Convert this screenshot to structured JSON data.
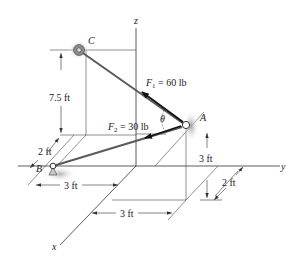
{
  "diagram": {
    "axes": {
      "x_label": "x",
      "y_label": "y",
      "z_label": "z"
    },
    "points": {
      "A": "A",
      "B": "B",
      "C": "C"
    },
    "forces": {
      "F1": {
        "symbol": "F",
        "subscript": "1",
        "value_text": " = 60 lb"
      },
      "F2": {
        "symbol": "F",
        "subscript": "2",
        "value_text": " = 30 lb"
      }
    },
    "angle_label": "θ",
    "dimensions": {
      "c_height": "7.5 ft",
      "b_offset_x": "2 ft",
      "b_offset_y": "3 ft",
      "a_offset_y": "3 ft",
      "a_height": "3 ft",
      "a_offset_x": "2 ft"
    },
    "colors": {
      "line": "#333333",
      "cable": "#5a5a5a",
      "force_arrow": "#111111",
      "support_shade": "#9a9a9a"
    }
  }
}
